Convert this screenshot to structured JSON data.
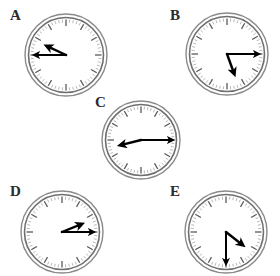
{
  "figure": {
    "type": "analog-clock-panel",
    "background_color": "#ffffff",
    "panel_count": 5,
    "width": 280,
    "height": 276
  },
  "style": {
    "rim_outer_color": "#8a8a8a",
    "rim_inner_color": "#6f6f6f",
    "face_color": "#ffffff",
    "tick_major_color": "#5a5a5a",
    "tick_minor_color": "#9a9a9a",
    "hand_color": "#000000",
    "label_color": "#2b2b2b"
  },
  "clocks": [
    {
      "label": "A",
      "label_x": 10,
      "label_y": 8,
      "cx": 66,
      "cy": 55,
      "radius": 41,
      "hour_angle_deg": 295,
      "minute_angle_deg": 270,
      "hour_hand_length": 21,
      "minute_hand_length": 31,
      "reading": "9:50"
    },
    {
      "label": "B",
      "label_x": 170,
      "label_y": 8,
      "cx": 227,
      "cy": 54,
      "radius": 41,
      "hour_angle_deg": 160,
      "minute_angle_deg": 90,
      "hour_hand_length": 21,
      "minute_hand_length": 31,
      "reading": "5:15"
    },
    {
      "label": "C",
      "label_x": 95,
      "label_y": 95,
      "cx": 141,
      "cy": 140,
      "radius": 39,
      "hour_angle_deg": 256,
      "minute_angle_deg": 90,
      "hour_hand_length": 21,
      "minute_hand_length": 31,
      "reading": "8:15"
    },
    {
      "label": "D",
      "label_x": 10,
      "label_y": 184,
      "cx": 62,
      "cy": 232,
      "radius": 41,
      "hour_angle_deg": 68,
      "minute_angle_deg": 90,
      "hour_hand_length": 21,
      "minute_hand_length": 31,
      "reading": "2:15"
    },
    {
      "label": "E",
      "label_x": 170,
      "label_y": 184,
      "cx": 226,
      "cy": 232,
      "radius": 41,
      "hour_angle_deg": 128,
      "minute_angle_deg": 180,
      "hour_hand_length": 21,
      "minute_hand_length": 31,
      "reading": "4:30"
    }
  ]
}
